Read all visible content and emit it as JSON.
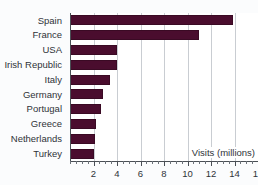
{
  "chart_data": {
    "type": "bar",
    "orientation": "horizontal",
    "title": "",
    "xlabel": "Visits (millions)",
    "ylabel": "",
    "categories": [
      "Spain",
      "France",
      "USA",
      "Irish Republic",
      "Italy",
      "Germany",
      "Portugal",
      "Greece",
      "Netherlands",
      "Turkey"
    ],
    "values": [
      13.9,
      11.0,
      4.0,
      4.0,
      3.4,
      2.8,
      2.6,
      2.2,
      2.1,
      2.0
    ],
    "xlim": [
      0,
      16
    ],
    "xticks": [
      2,
      4,
      6,
      8,
      10,
      12,
      14,
      16
    ],
    "xtick_labels": [
      "2",
      "4",
      "6",
      "8",
      "10",
      "12",
      "14",
      "16"
    ],
    "minor_tick_step": 0.5,
    "grid": "vertical",
    "legend": "none",
    "bar_color": "#4a0d2e",
    "plot_background": "#ffffff",
    "figure_background": "#fbfcfd",
    "gridline_color": "#c9cdd2",
    "axis_color": "#4a4f55"
  },
  "axis": {
    "label_text": "Visits (millions)"
  },
  "title": {
    "text": ""
  }
}
